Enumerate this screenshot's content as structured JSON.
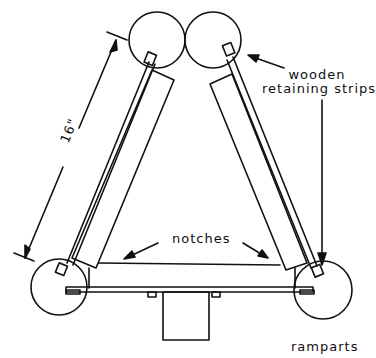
{
  "diagram": {
    "labels": {
      "retaining_strips_line1": "wooden",
      "retaining_strips_line2": "retaining strips",
      "notches": "notches",
      "ramparts": "ramparts",
      "dimension": "16\""
    },
    "colors": {
      "ink": "#111111",
      "background": "#ffffff"
    },
    "components": [
      "top-left-circle",
      "top-right-circle",
      "bottom-left-circle",
      "bottom-right-circle",
      "left-strip",
      "right-strip",
      "left-panel",
      "right-panel",
      "base-bar",
      "base-box"
    ]
  }
}
